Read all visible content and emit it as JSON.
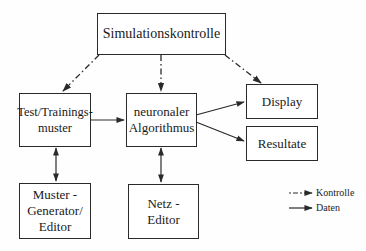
{
  "diagram": {
    "nodes": {
      "simulation_control": {
        "label": "Simulationskontrolle"
      },
      "test_training": {
        "label": "Test/Trainings-\nmuster"
      },
      "neural_algorithm": {
        "label": "neuronaler\nAlgorithmus"
      },
      "display": {
        "label": "Display"
      },
      "results": {
        "label": "Resultate"
      },
      "pattern_generator": {
        "label": "Muster -\nGenerator/\nEditor"
      },
      "net_editor": {
        "label": "Netz -\nEditor"
      }
    },
    "edges": [
      {
        "from": "simulation_control",
        "to": "test_training",
        "type": "control"
      },
      {
        "from": "simulation_control",
        "to": "neural_algorithm",
        "type": "control"
      },
      {
        "from": "simulation_control",
        "to": "display",
        "type": "control"
      },
      {
        "from": "test_training",
        "to": "neural_algorithm",
        "type": "data"
      },
      {
        "from": "neural_algorithm",
        "to": "display",
        "type": "data"
      },
      {
        "from": "neural_algorithm",
        "to": "results",
        "type": "data"
      },
      {
        "from": "test_training",
        "to": "pattern_generator",
        "type": "data",
        "bidirectional": true
      },
      {
        "from": "neural_algorithm",
        "to": "net_editor",
        "type": "data",
        "bidirectional": true
      }
    ],
    "legend": {
      "control": "Kontrolle",
      "data": "Daten"
    },
    "colors": {
      "line": "#2a2a2a",
      "background": "#fefefe"
    }
  }
}
